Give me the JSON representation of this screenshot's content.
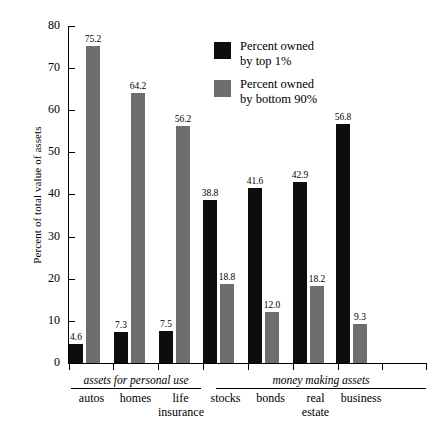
{
  "chart_data": {
    "type": "bar",
    "title": "",
    "xlabel": "",
    "ylabel": "Percent of total value of assets",
    "ylim": [
      0,
      80
    ],
    "yticks": [
      0,
      10,
      20,
      30,
      40,
      50,
      60,
      70,
      80
    ],
    "grid": false,
    "legend_position": "top-right",
    "categories": [
      "autos",
      "homes",
      "life insurance",
      "stocks",
      "bonds",
      "real estate",
      "business"
    ],
    "groups": [
      {
        "title": "assets for personal use",
        "categories": [
          "autos",
          "homes",
          "life insurance"
        ]
      },
      {
        "title": "money making assets",
        "categories": [
          "stocks",
          "bonds",
          "real estate",
          "business"
        ]
      }
    ],
    "series": [
      {
        "name": "Percent owned by top 1%",
        "color": "#0d0d0d",
        "values": [
          4.6,
          7.3,
          7.5,
          38.8,
          41.6,
          42.9,
          56.8
        ],
        "labels": [
          "4.6",
          "7.3",
          "7.5",
          "38.8",
          "41.6",
          "42.9",
          "56.8"
        ]
      },
      {
        "name": "Percent owned by bottom 90%",
        "color": "#6e6e6e",
        "values": [
          75.2,
          64.2,
          56.2,
          18.8,
          12.0,
          18.2,
          9.3
        ],
        "labels": [
          "75.2",
          "64.2",
          "56.2",
          "18.8",
          "12.0",
          "18.2",
          "9.3"
        ]
      }
    ]
  },
  "axis": {
    "y_label": "Percent of total value of assets",
    "y_tick_labels": [
      "80",
      "70",
      "60",
      "50",
      "40",
      "30",
      "20",
      "10",
      "0"
    ]
  },
  "legend": {
    "items": [
      {
        "line1": "Percent owned",
        "line2": "by top 1%",
        "swatch": "black"
      },
      {
        "line1": "Percent owned",
        "line2": "by bottom 90%",
        "swatch": "gray"
      }
    ]
  },
  "groups": {
    "personal": "assets for personal use",
    "money": "money making assets"
  },
  "categories": {
    "autos": "autos",
    "homes": "homes",
    "life_1": "life",
    "life_2": "insurance",
    "stocks": "stocks",
    "bonds": "bonds",
    "real_1": "real",
    "real_2": "estate",
    "business": "business"
  }
}
